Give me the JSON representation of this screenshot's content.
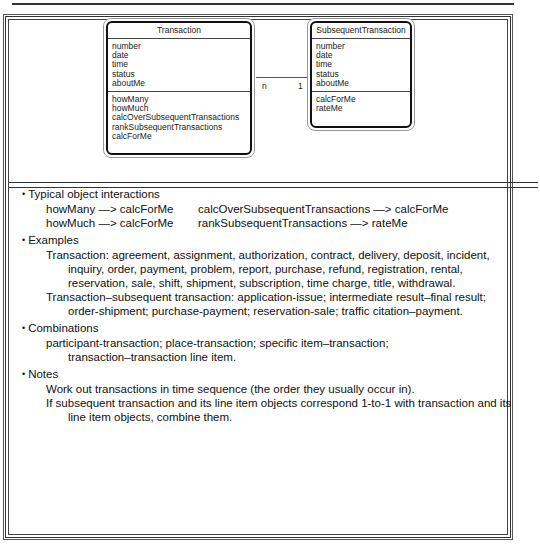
{
  "diagram": {
    "transaction": {
      "name": "Transaction",
      "attributes": [
        "number",
        "date",
        "time",
        "status",
        "aboutMe"
      ],
      "services": [
        "howMany",
        "howMuch",
        "calcOverSubsequentTransactions",
        "rankSubsequentTransactions",
        "calcForMe"
      ]
    },
    "subsequent_transaction": {
      "name": "SubsequentTransaction",
      "attributes": [
        "number",
        "date",
        "time",
        "status",
        "aboutMe"
      ],
      "services": [
        "calcForMe",
        "rateMe"
      ]
    },
    "association": {
      "left_multiplicity": "n",
      "right_multiplicity": "1"
    }
  },
  "sections": {
    "interactions": {
      "heading": "Typical object interactions",
      "items": [
        "howMany —> calcForMe",
        "calcOverSubsequentTransactions —> calcForMe",
        "howMuch —> calcForMe",
        "rankSubsequentTransactions —> rateMe"
      ]
    },
    "examples": {
      "heading": "Examples",
      "items": [
        "Transaction: agreement, assignment, authorization, contract, delivery, deposit, incident, inquiry, order, payment, problem, report, purchase, refund, registration, rental, reservation, sale, shift, shipment, subscription, time charge, title, withdrawal.",
        "Transaction–subsequent transaction: application-issue; intermediate result–final result; order-shipment; purchase-payment; reservation-sale; traffic citation–payment."
      ]
    },
    "combinations": {
      "heading": "Combinations",
      "items": [
        "participant-transaction; place-transaction; specific item–transaction; transaction–transaction line item."
      ]
    },
    "notes": {
      "heading": "Notes",
      "items": [
        "Work out transactions in time sequence (the order they usually occur in).",
        "If subsequent transaction and its line item objects correspond 1-to-1 with transaction and its line item objects, combine them."
      ]
    }
  }
}
